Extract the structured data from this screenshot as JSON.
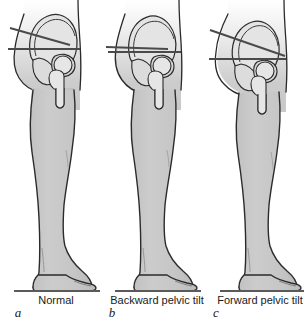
{
  "figure": {
    "background_color": "#ffffff",
    "outline_color": "#1a1a1a",
    "limb_fill_color": "#c9c9c9",
    "bone_fill_color": "#e2e2e2",
    "reference_line_color": "#4a4a4a",
    "ground_line_color": "#5a5a5a",
    "panel_count": 3
  },
  "panels": [
    {
      "letter": "a",
      "caption": "Normal",
      "tilt_type": "normal",
      "horizontal_reference_line": "present",
      "pelvic_axis_line": "present",
      "axis_angle_degrees": -11
    },
    {
      "letter": "b",
      "caption": "Backward pelvic tilt",
      "tilt_type": "backward",
      "horizontal_reference_line": "present",
      "pelvic_axis_line": "present",
      "axis_angle_degrees": -2
    },
    {
      "letter": "c",
      "caption": "Forward pelvic tilt",
      "tilt_type": "forward",
      "horizontal_reference_line": "present",
      "pelvic_axis_line": "present",
      "axis_angle_degrees": -19
    }
  ],
  "anatomy_labels": {
    "pelvis": "pelvis",
    "ilium": "ilium",
    "acetabulum": "acetabulum",
    "femoral_head": "femoral head",
    "femoral_neck": "femoral neck",
    "greater_trochanter": "greater trochanter",
    "femur_shaft": "femur shaft",
    "thigh": "thigh",
    "knee": "knee",
    "shank": "shank",
    "ankle": "ankle",
    "foot": "foot",
    "ground": "ground line"
  }
}
